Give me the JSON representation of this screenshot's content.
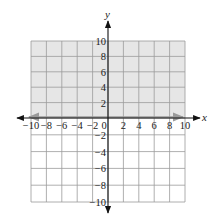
{
  "chart_data": {
    "type": "inequality-graph",
    "title": "",
    "xlabel": "x",
    "ylabel": "y",
    "xlim": [
      -10,
      10
    ],
    "ylim": [
      -10,
      10
    ],
    "grid": true,
    "grid_step": 2,
    "x_ticks": [
      -10,
      -8,
      -6,
      -4,
      -2,
      0,
      2,
      4,
      6,
      8,
      10
    ],
    "x_tick_labels": [
      "−10",
      "−8",
      "−6",
      "−4",
      "−2",
      "0",
      "2",
      "4",
      "6",
      "8",
      "10"
    ],
    "y_ticks": [
      10,
      8,
      6,
      4,
      2,
      -2,
      -4,
      -6,
      -8,
      -10
    ],
    "y_tick_labels": [
      "10",
      "8",
      "6",
      "4",
      "2",
      "−2",
      "−4",
      "−6",
      "−8",
      "−10"
    ],
    "boundary_line": {
      "equation": "y = 0",
      "style": "solid",
      "color": "#999999"
    },
    "shaded_region": {
      "inequality": "y ≥ 0",
      "y_range": [
        0,
        10
      ],
      "color": "#e6e6e6"
    }
  },
  "colors": {
    "shade": "#e6e6e6",
    "grid": "#9a9a9a",
    "axis": "#111111",
    "boundary": "#9a9a9a",
    "text": "#222222"
  }
}
